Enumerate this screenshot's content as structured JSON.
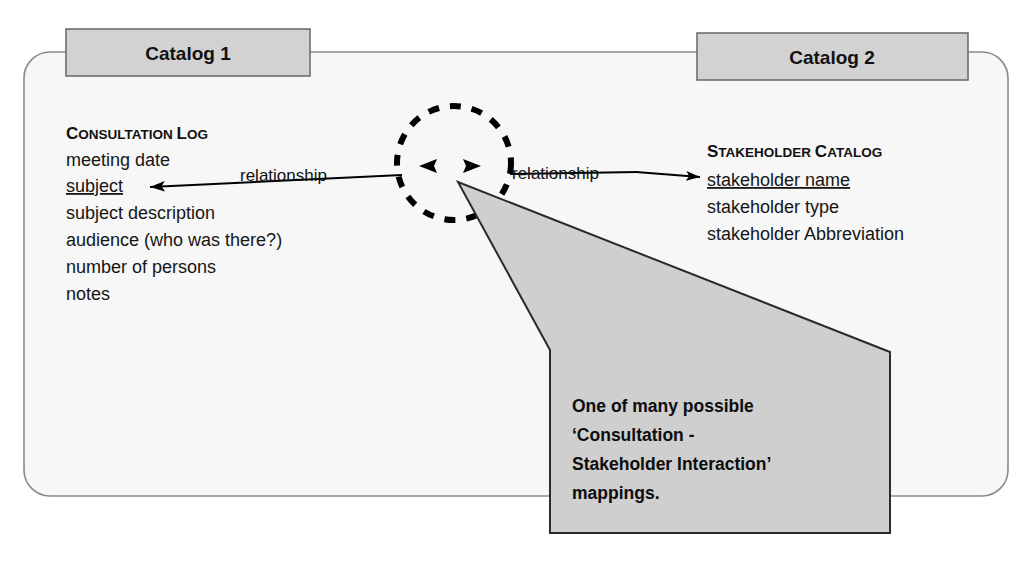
{
  "canvas": {
    "width": 1031,
    "height": 562,
    "background": "#ffffff"
  },
  "colors": {
    "panel_fill": "#f7f7f7",
    "panel_stroke": "#8a8a8a",
    "tab_fill": "#d2d2d2",
    "tab_stroke": "#6e6e6e",
    "callout_fill": "#cfcfcf",
    "callout_stroke": "#2a2a2a",
    "ink": "#111111",
    "arrow": "#000000",
    "dashed_circle": "#000000"
  },
  "panel": {
    "name": "catalog-panel",
    "tabs": [
      {
        "id": "catalog-1",
        "label": "Catalog 1"
      },
      {
        "id": "catalog-2",
        "label": "Catalog 2"
      }
    ]
  },
  "entities": [
    {
      "id": "consultation-log",
      "title": "Consultation log",
      "title_first_letters": [
        "C",
        "L"
      ],
      "attributes": [
        {
          "text": "meeting date",
          "key": false
        },
        {
          "text": "subject",
          "key": true
        },
        {
          "text": "subject description",
          "key": false
        },
        {
          "text": "audience (who was there?)",
          "key": false
        },
        {
          "text": "number of persons",
          "key": false
        },
        {
          "text": "notes",
          "key": false
        }
      ]
    },
    {
      "id": "stakeholder-catalog",
      "title": "Stakeholder Catalog",
      "title_first_letters": [
        "S",
        "C"
      ],
      "attributes": [
        {
          "text": "stakeholder name",
          "key": true
        },
        {
          "text": "stakeholder type",
          "key": false
        },
        {
          "text": "stakeholder Abbreviation",
          "key": false
        }
      ]
    }
  ],
  "relationship_node": {
    "id": "relationship-node",
    "shape": "dashed-circle",
    "center_x": 454,
    "center_y": 163,
    "radius": 57
  },
  "connectors": [
    {
      "id": "relationship-left",
      "label": "relationship",
      "from": "relationship-node",
      "to": "consultation-log.subject",
      "direction": "left"
    },
    {
      "id": "relationship-right",
      "label": "relationship",
      "from": "relationship-node",
      "to": "stakeholder-catalog.stakeholder-name",
      "direction": "right"
    }
  ],
  "callout": {
    "id": "mapping-callout",
    "lines": [
      "One of many possible",
      "‘Consultation -",
      "Stakeholder Interaction’",
      "mappings."
    ]
  }
}
